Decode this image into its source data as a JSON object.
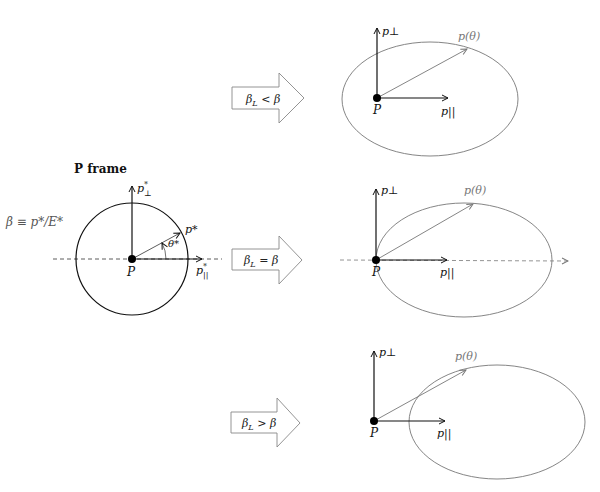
{
  "title": "P frame",
  "beta_def": "β ≡ p*/E*",
  "p_frame": {
    "origin_label": "P",
    "perp_axis_label": "p*⊥",
    "par_axis_label": "p*||",
    "vector_label": "p*",
    "angle_label": "θ*"
  },
  "arrows": [
    {
      "label": "β_L < β",
      "main": "β",
      "sub": "L",
      "rel": " < β"
    },
    {
      "label": "β_L = β",
      "main": "β",
      "sub": "L",
      "rel": " = β"
    },
    {
      "label": "β_L > β",
      "main": "β",
      "sub": "L",
      "rel": " > β"
    }
  ],
  "lab_frames": [
    {
      "case": "β_L < β",
      "origin_label": "P",
      "perp_label": "p⊥",
      "par_label": "p||",
      "vector_label": "p(θ)"
    },
    {
      "case": "β_L = β",
      "origin_label": "P",
      "perp_label": "p⊥",
      "par_label": "p||",
      "vector_label": "p(θ)"
    },
    {
      "case": "β_L > β",
      "origin_label": "P",
      "perp_label": "p⊥",
      "par_label": "p||",
      "vector_label": "p(θ)"
    }
  ],
  "colors": {
    "ink": "#111111",
    "gray": "#777777",
    "arrow_stroke": "#888888"
  }
}
